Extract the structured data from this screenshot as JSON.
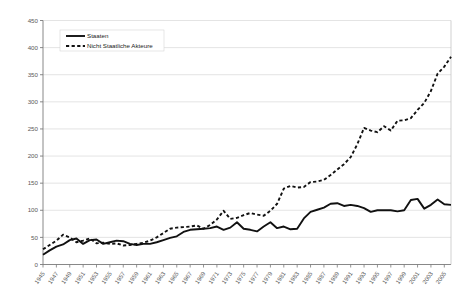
{
  "chart_data": {
    "type": "line",
    "title": "",
    "xlabel": "",
    "ylabel": "",
    "ylim": [
      0,
      450
    ],
    "ytick_step": 50,
    "yticks": [
      0,
      50,
      100,
      150,
      200,
      250,
      300,
      350,
      400,
      450
    ],
    "grid": true,
    "grid_axis": "y",
    "legend_position": "top-left",
    "x_tick_step": 2,
    "x_first_tick": 1945,
    "x": [
      1945,
      1946,
      1947,
      1948,
      1949,
      1950,
      1951,
      1952,
      1953,
      1954,
      1955,
      1956,
      1957,
      1958,
      1959,
      1960,
      1961,
      1962,
      1963,
      1964,
      1965,
      1966,
      1967,
      1968,
      1969,
      1970,
      1971,
      1972,
      1973,
      1974,
      1975,
      1976,
      1977,
      1978,
      1979,
      1980,
      1981,
      1982,
      1983,
      1984,
      1985,
      1986,
      1987,
      1988,
      1989,
      1990,
      1991,
      1992,
      1993,
      1994,
      1995,
      1996,
      1997,
      1998,
      1999,
      2000,
      2001,
      2002,
      2003,
      2004,
      2005,
      2006
    ],
    "xticklabels": [
      "1945",
      "1947",
      "1949",
      "1951",
      "1953",
      "1955",
      "1957",
      "1959",
      "1961",
      "1963",
      "1965",
      "1967",
      "1969",
      "1971",
      "1973",
      "1975",
      "1977",
      "1979",
      "1981",
      "1983",
      "1985",
      "1987",
      "1989",
      "1991",
      "1993",
      "1995",
      "1997",
      "1999",
      "2001",
      "2003",
      "2005"
    ],
    "series": [
      {
        "name": "Staaten",
        "style": "solid",
        "color": "#111111",
        "values": [
          18,
          26,
          33,
          37,
          45,
          48,
          38,
          45,
          46,
          38,
          41,
          44,
          43,
          38,
          36,
          38,
          38,
          41,
          45,
          49,
          52,
          60,
          64,
          65,
          66,
          67,
          70,
          64,
          68,
          78,
          66,
          64,
          61,
          70,
          78,
          67,
          70,
          65,
          66,
          85,
          97,
          101,
          105,
          112,
          113,
          108,
          110,
          108,
          104,
          97,
          100,
          100,
          100,
          98,
          100,
          119,
          121,
          103,
          110,
          120,
          111,
          110
        ]
      },
      {
        "name": "Nicht Staatliche Akteure",
        "style": "dashed",
        "color": "#111111",
        "values": [
          28,
          36,
          44,
          55,
          50,
          41,
          44,
          48,
          39,
          40,
          38,
          39,
          35,
          36,
          38,
          40,
          44,
          50,
          58,
          66,
          68,
          69,
          70,
          72,
          66,
          73,
          83,
          99,
          84,
          86,
          91,
          95,
          92,
          90,
          99,
          112,
          140,
          145,
          142,
          143,
          152,
          153,
          156,
          165,
          175,
          185,
          198,
          222,
          252,
          247,
          244,
          255,
          247,
          265,
          266,
          270,
          285,
          298,
          320,
          352,
          365,
          383
        ]
      }
    ]
  },
  "legend": {
    "items": [
      {
        "label": "Staaten",
        "style": "solid"
      },
      {
        "label": "Nicht Staatliche Akteure",
        "style": "dashed"
      }
    ]
  }
}
